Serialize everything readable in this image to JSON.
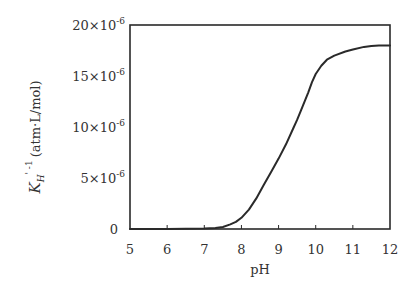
{
  "chart_data": {
    "type": "line",
    "title": "",
    "xlabel": "pH",
    "ylabel": "K'_H^-1 (atm·L/mol)",
    "ylabel_parts": {
      "main": "K",
      "prime": "'",
      "sub": "H",
      "sup": "-1",
      "unit": "(atm·L/mol)"
    },
    "xlim": [
      5,
      12
    ],
    "ylim": [
      0,
      2e-05
    ],
    "grid": false,
    "legend": "none",
    "x_ticks": [
      5,
      6,
      7,
      8,
      9,
      10,
      11,
      12
    ],
    "x_tick_labels": [
      "5",
      "6",
      "7",
      "8",
      "9",
      "10",
      "11",
      "12"
    ],
    "y_ticks": [
      0,
      5e-06,
      1e-05,
      1.5e-05,
      2e-05
    ],
    "y_tick_labels": [
      {
        "value": 0,
        "mantissa": "0",
        "exp": ""
      },
      {
        "value": 5e-06,
        "mantissa": "5",
        "exp": "-6"
      },
      {
        "value": 1e-05,
        "mantissa": "10",
        "exp": "-6"
      },
      {
        "value": 1.5e-05,
        "mantissa": "15",
        "exp": "-6"
      },
      {
        "value": 2e-05,
        "mantissa": "20",
        "exp": "-6"
      }
    ],
    "series": [
      {
        "name": "K'_H^-1",
        "color": "#2a2a2a",
        "x": [
          5.0,
          6.0,
          7.0,
          7.3,
          7.5,
          7.7,
          7.85,
          8.0,
          8.2,
          8.4,
          8.6,
          8.8,
          9.0,
          9.2,
          9.4,
          9.5,
          9.6,
          9.8,
          9.9,
          10.0,
          10.15,
          10.3,
          10.5,
          10.8,
          11.0,
          11.3,
          11.5,
          11.7,
          12.0
        ],
        "y": [
          0.0,
          0.0,
          5e-08,
          1e-07,
          2e-07,
          4.5e-07,
          7e-07,
          1.1e-06,
          1.9e-06,
          3e-06,
          4.3e-06,
          5.6e-06,
          6.9e-06,
          8.3e-06,
          9.9e-06,
          1.07e-05,
          1.16e-05,
          1.34e-05,
          1.44e-05,
          1.52e-05,
          1.6e-05,
          1.66e-05,
          1.7e-05,
          1.74e-05,
          1.76e-05,
          1.785e-05,
          1.795e-05,
          1.8e-05,
          1.8e-05
        ]
      }
    ]
  }
}
